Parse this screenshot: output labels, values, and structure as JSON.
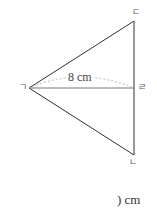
{
  "figure": {
    "type": "isosceles-triangle",
    "vertices": {
      "apex_left": {
        "label": "ㄱ",
        "x": 29,
        "y": 88
      },
      "top": {
        "label": "ㄷ",
        "x": 134,
        "y": 21
      },
      "bottom": {
        "label": "ㄴ",
        "x": 134,
        "y": 155
      },
      "foot": {
        "label": "ㄹ",
        "x": 134,
        "y": 88
      }
    },
    "segment_label": "8 cm",
    "colors": {
      "line": "#333333",
      "dashed": "#aaaaaa",
      "label": "#555555"
    }
  },
  "answer": {
    "text": ") cm"
  }
}
